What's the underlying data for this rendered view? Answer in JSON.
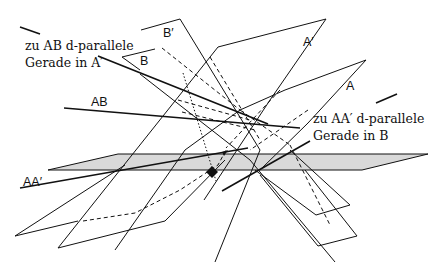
{
  "annotations": {
    "line_ab_in_a1": {
      "line1": "zu AB d-parallele",
      "line2": "Gerade in A′"
    },
    "line_aa1_in_b": {
      "line1": "zu AA′ d-parallele",
      "line2": "Gerade in B"
    }
  },
  "labels": {
    "B_prime": "B′",
    "A_prime": "A′",
    "B": "B",
    "A": "A",
    "AB": "AB",
    "AA_prime": "AA′"
  },
  "colors": {
    "stroke": "#111111",
    "plane_fill": "#d9d9d9",
    "background": "#ffffff"
  }
}
